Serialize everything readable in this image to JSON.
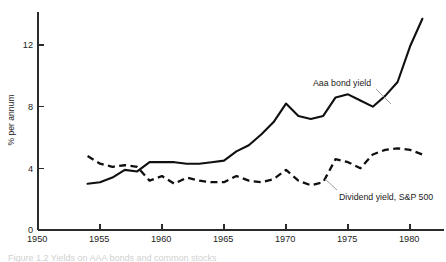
{
  "figure": {
    "caption": "Figure 1.2  Yields on AAA bonds and common stocks"
  },
  "annotations": {
    "bond_label": "Aaa bond yield",
    "dividend_label": "Dividend yield, S&P 500"
  },
  "axes": {
    "ylabel": "% per annum",
    "y_ticks": [
      "0",
      "4",
      "8",
      "12"
    ],
    "x_ticks": [
      "1950",
      "1955",
      "1960",
      "1965",
      "1970",
      "1975",
      "1980"
    ]
  },
  "chart_data": {
    "type": "line",
    "title": "",
    "xlabel": "",
    "ylabel": "% per annum",
    "xlim": [
      1950,
      1982
    ],
    "ylim": [
      0,
      14
    ],
    "grid": false,
    "legend": "inline-annotations",
    "x_ticks": [
      1950,
      1955,
      1960,
      1965,
      1970,
      1975,
      1980
    ],
    "y_ticks": [
      0,
      4,
      8,
      12
    ],
    "series": [
      {
        "name": "Aaa bond yield",
        "style": "solid",
        "x": [
          1954,
          1955,
          1956,
          1957,
          1958,
          1959,
          1960,
          1961,
          1962,
          1963,
          1964,
          1965,
          1966,
          1967,
          1968,
          1969,
          1970,
          1971,
          1972,
          1973,
          1974,
          1975,
          1976,
          1977,
          1978,
          1979,
          1980,
          1981
        ],
        "values": [
          3.0,
          3.1,
          3.4,
          3.9,
          3.8,
          4.4,
          4.4,
          4.4,
          4.3,
          4.3,
          4.4,
          4.5,
          5.1,
          5.5,
          6.2,
          7.0,
          8.2,
          7.4,
          7.2,
          7.4,
          8.6,
          8.8,
          8.4,
          8.0,
          8.7,
          9.6,
          11.9,
          13.7
        ]
      },
      {
        "name": "Dividend yield, S&P 500",
        "style": "dashed",
        "x": [
          1954,
          1955,
          1956,
          1957,
          1958,
          1959,
          1960,
          1961,
          1962,
          1963,
          1964,
          1965,
          1966,
          1967,
          1968,
          1969,
          1970,
          1971,
          1972,
          1973,
          1974,
          1975,
          1976,
          1977,
          1978,
          1979,
          1980,
          1981
        ],
        "values": [
          4.8,
          4.3,
          4.1,
          4.2,
          4.1,
          3.2,
          3.5,
          3.0,
          3.4,
          3.2,
          3.1,
          3.1,
          3.5,
          3.2,
          3.1,
          3.3,
          3.9,
          3.2,
          2.9,
          3.1,
          4.6,
          4.4,
          4.0,
          4.9,
          5.2,
          5.3,
          5.2,
          4.9
        ]
      }
    ]
  }
}
